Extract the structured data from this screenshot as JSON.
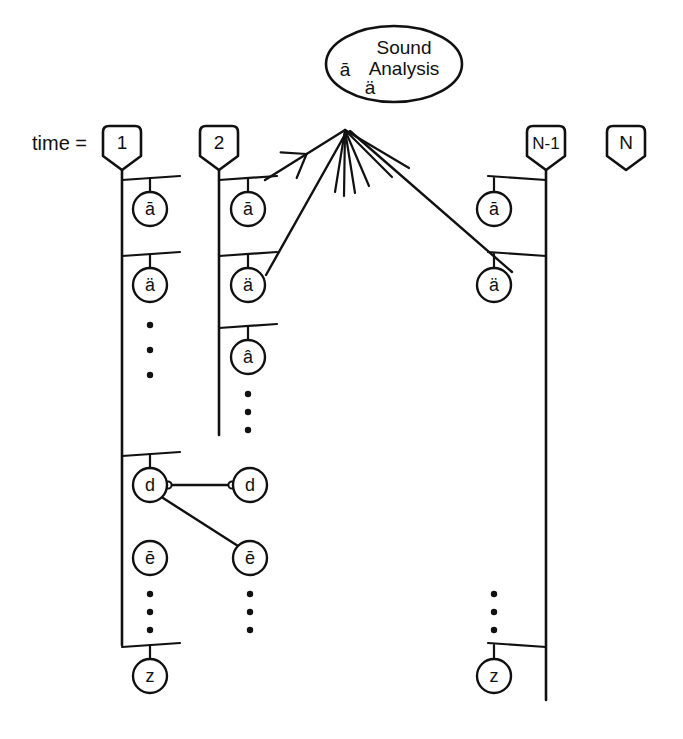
{
  "figure": {
    "title_label": "time =",
    "background": "#ffffff",
    "stroke": "#111111",
    "width": 683,
    "height": 739
  },
  "sound_analysis": {
    "line1": "Sound",
    "line2": "Analysis",
    "symbol_top": "ā",
    "symbol_bottom": "ä",
    "shape": "ellipse",
    "cx": 394,
    "cy": 64,
    "rx": 68,
    "ry": 38
  },
  "time_steps": [
    {
      "name": "step-1",
      "label": "1",
      "shield_cx": 122,
      "shield_top": 126
    },
    {
      "name": "step-2",
      "label": "2",
      "shield_cx": 219,
      "shield_top": 126
    },
    {
      "name": "step-n-1",
      "label": "N-1",
      "shield_cx": 546,
      "shield_top": 126
    },
    {
      "name": "step-n",
      "label": "N",
      "shield_cx": 626,
      "shield_top": 126
    }
  ],
  "columns": [
    {
      "name": "column-1",
      "step_label": "1",
      "axis_x": 122,
      "axis_top": 170,
      "axis_bottom": 645,
      "side": "right",
      "nodes": [
        {
          "name": "node-a-macron",
          "label": "ā",
          "cx": 150,
          "cy": 209,
          "branch_y": 180
        },
        {
          "name": "node-a-diaeresis",
          "label": "ä",
          "cx": 150,
          "cy": 285,
          "branch_y": 256
        },
        {
          "name": "node-d",
          "label": "d",
          "cx": 150,
          "cy": 485,
          "branch_y": 456
        },
        {
          "name": "node-e-macron",
          "label": "ē",
          "cx": 150,
          "cy": 558,
          "branch_y": null
        },
        {
          "name": "node-z",
          "label": "z",
          "cx": 150,
          "cy": 676,
          "branch_y": 647
        }
      ],
      "ellipses": [
        {
          "name": "vdots-upper",
          "cx": 150,
          "y": [
            325,
            350,
            375
          ]
        },
        {
          "name": "vdots-lower",
          "cx": 150,
          "y": [
            594,
            612,
            630
          ]
        }
      ]
    },
    {
      "name": "column-2",
      "step_label": "2",
      "axis_x": 219,
      "axis_top": 170,
      "axis_bottom": 435,
      "side": "right",
      "nodes": [
        {
          "name": "node-a-macron",
          "label": "ā",
          "cx": 248,
          "cy": 209,
          "branch_y": 180
        },
        {
          "name": "node-a-diaeresis",
          "label": "ä",
          "cx": 248,
          "cy": 285,
          "branch_y": 256
        },
        {
          "name": "node-a-circumflex",
          "label": "â",
          "cx": 248,
          "cy": 357,
          "branch_y": 328
        },
        {
          "name": "node-d",
          "label": "d",
          "cx": 250,
          "cy": 485,
          "branch_y": null
        },
        {
          "name": "node-e-macron",
          "label": "ē",
          "cx": 250,
          "cy": 558,
          "branch_y": null
        }
      ],
      "ellipses": [
        {
          "name": "vdots-upper",
          "cx": 248,
          "y": [
            394,
            412,
            430
          ]
        },
        {
          "name": "vdots-lower",
          "cx": 250,
          "y": [
            594,
            612,
            630
          ]
        }
      ]
    },
    {
      "name": "column-n-1",
      "step_label": "N-1",
      "axis_x": 546,
      "axis_top": 170,
      "axis_bottom": 700,
      "side": "left",
      "nodes": [
        {
          "name": "node-a-macron",
          "label": "ā",
          "cx": 494,
          "cy": 209,
          "branch_y": 180
        },
        {
          "name": "node-a-diaeresis",
          "label": "ä",
          "cx": 494,
          "cy": 285,
          "branch_y": 256
        },
        {
          "name": "node-z",
          "label": "z",
          "cx": 494,
          "cy": 676,
          "branch_y": 647
        }
      ],
      "ellipses": [
        {
          "name": "vdots-lower",
          "cx": 494,
          "y": [
            594,
            612,
            630
          ]
        }
      ]
    },
    {
      "name": "column-n",
      "step_label": "N",
      "axis_x": 626,
      "axis_top": 170,
      "axis_bottom": 170,
      "side": "none",
      "nodes": [],
      "ellipses": []
    }
  ],
  "links": {
    "analysis_arrows": [
      {
        "name": "arrow-from-column2-a-macron",
        "from": [
          265,
          180
        ],
        "to": [
          345,
          130
        ],
        "arrowhead": true
      },
      {
        "name": "arrow-from-column2-a-diaeresis",
        "from": [
          266,
          275
        ],
        "to": [
          347,
          131
        ],
        "arrowhead": false
      },
      {
        "name": "arrow-from-column-n-1-a-diaeresis",
        "from": [
          512,
          272
        ],
        "to": [
          350,
          131
        ],
        "arrowhead": false
      }
    ],
    "sheaf": {
      "name": "analysis-sheaf",
      "apex": [
        345,
        130
      ],
      "ends": [
        [
          335,
          192
        ],
        [
          344,
          196
        ],
        [
          355,
          193
        ],
        [
          369,
          186
        ],
        [
          392,
          177
        ],
        [
          409,
          168
        ]
      ]
    },
    "node_links": [
      {
        "name": "link-d-to-d",
        "from": [
          168,
          485
        ],
        "to": [
          232,
          485
        ],
        "endpoints": "open-circles"
      },
      {
        "name": "link-d-to-e-macron",
        "from": [
          163,
          498
        ],
        "to": [
          238,
          546
        ],
        "endpoints": "plain"
      }
    ]
  },
  "geometry": {
    "circle_radius": 17,
    "shield_half_width": 19,
    "shield_body_height": 30,
    "shield_point_depth": 14,
    "branch_half_span": 30,
    "dot_radius": 3.2,
    "stroke_width": 2.2
  }
}
